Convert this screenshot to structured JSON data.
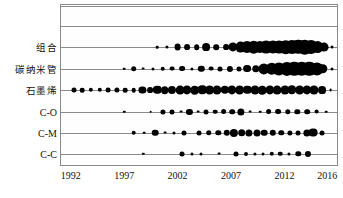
{
  "chart_data": {
    "type": "scatter",
    "title": "",
    "subtitle": "",
    "xlabel": "",
    "ylabel": "",
    "xlim": [
      1991,
      2017
    ],
    "xticks": [
      1992,
      1997,
      2002,
      2007,
      2012,
      2016
    ],
    "xtick_labels": [
      "1992",
      "1997",
      "2002",
      "2007",
      "2012",
      "2016"
    ],
    "categories": [
      "组合",
      "碳纳米管",
      "石墨烯",
      "C-O",
      "C-M",
      "C-C"
    ],
    "grid": true,
    "legend": "none",
    "size_encoding": "bubble area proportional to publication count",
    "series": [
      {
        "name": "组合",
        "points": [
          {
            "x": 2000.1,
            "s": 1.3
          },
          {
            "x": 2001.0,
            "s": 1.6
          },
          {
            "x": 2002.0,
            "s": 3.4
          },
          {
            "x": 2002.9,
            "s": 2.9
          },
          {
            "x": 2003.8,
            "s": 2.8
          },
          {
            "x": 2004.7,
            "s": 3.9
          },
          {
            "x": 2005.6,
            "s": 2.8
          },
          {
            "x": 2006.5,
            "s": 2.9
          },
          {
            "x": 2007.2,
            "s": 4.6
          },
          {
            "x": 2007.9,
            "s": 5.4
          },
          {
            "x": 2008.5,
            "s": 6.0
          },
          {
            "x": 2009.1,
            "s": 6.3
          },
          {
            "x": 2009.7,
            "s": 6.1
          },
          {
            "x": 2010.3,
            "s": 6.4
          },
          {
            "x": 2010.9,
            "s": 6.6
          },
          {
            "x": 2011.5,
            "s": 6.4
          },
          {
            "x": 2012.1,
            "s": 6.8
          },
          {
            "x": 2012.7,
            "s": 7.0
          },
          {
            "x": 2013.3,
            "s": 7.2
          },
          {
            "x": 2013.9,
            "s": 7.3
          },
          {
            "x": 2014.5,
            "s": 7.0
          },
          {
            "x": 2015.1,
            "s": 5.9
          },
          {
            "x": 2015.7,
            "s": 4.4
          },
          {
            "x": 2016.4,
            "s": 1.5
          }
        ]
      },
      {
        "name": "碳纳米管",
        "points": [
          {
            "x": 1997.0,
            "s": 1.3
          },
          {
            "x": 1997.9,
            "s": 2.8
          },
          {
            "x": 1998.8,
            "s": 1.4
          },
          {
            "x": 1999.7,
            "s": 1.5
          },
          {
            "x": 2000.6,
            "s": 2.3
          },
          {
            "x": 2001.5,
            "s": 2.4
          },
          {
            "x": 2002.4,
            "s": 2.9
          },
          {
            "x": 2003.3,
            "s": 1.6
          },
          {
            "x": 2004.2,
            "s": 3.2
          },
          {
            "x": 2005.1,
            "s": 2.4
          },
          {
            "x": 2006.0,
            "s": 2.5
          },
          {
            "x": 2006.9,
            "s": 3.1
          },
          {
            "x": 2007.7,
            "s": 2.5
          },
          {
            "x": 2008.5,
            "s": 3.9
          },
          {
            "x": 2009.3,
            "s": 3.7
          },
          {
            "x": 2010.1,
            "s": 5.6
          },
          {
            "x": 2010.8,
            "s": 6.2
          },
          {
            "x": 2011.5,
            "s": 6.6
          },
          {
            "x": 2012.2,
            "s": 7.1
          },
          {
            "x": 2012.9,
            "s": 7.2
          },
          {
            "x": 2013.6,
            "s": 7.3
          },
          {
            "x": 2014.3,
            "s": 7.2
          },
          {
            "x": 2015.0,
            "s": 6.6
          },
          {
            "x": 2015.6,
            "s": 4.7
          },
          {
            "x": 2016.4,
            "s": 1.5
          }
        ]
      },
      {
        "name": "石墨烯",
        "points": [
          {
            "x": 1992.3,
            "s": 2.5
          },
          {
            "x": 1993.1,
            "s": 2.3
          },
          {
            "x": 1993.9,
            "s": 2.2
          },
          {
            "x": 1994.7,
            "s": 2.2
          },
          {
            "x": 1995.5,
            "s": 2.4
          },
          {
            "x": 1996.3,
            "s": 2.6
          },
          {
            "x": 1997.1,
            "s": 2.3
          },
          {
            "x": 1997.9,
            "s": 2.3
          },
          {
            "x": 1998.7,
            "s": 3.6
          },
          {
            "x": 1999.4,
            "s": 2.9
          },
          {
            "x": 2000.1,
            "s": 4.2
          },
          {
            "x": 2000.8,
            "s": 3.8
          },
          {
            "x": 2001.5,
            "s": 4.1
          },
          {
            "x": 2002.2,
            "s": 4.4
          },
          {
            "x": 2002.9,
            "s": 4.6
          },
          {
            "x": 2003.6,
            "s": 4.3
          },
          {
            "x": 2004.3,
            "s": 4.7
          },
          {
            "x": 2005.0,
            "s": 4.4
          },
          {
            "x": 2005.7,
            "s": 4.5
          },
          {
            "x": 2006.4,
            "s": 4.2
          },
          {
            "x": 2007.1,
            "s": 4.6
          },
          {
            "x": 2007.8,
            "s": 4.4
          },
          {
            "x": 2008.5,
            "s": 4.2
          },
          {
            "x": 2009.2,
            "s": 4.5
          },
          {
            "x": 2009.9,
            "s": 4.3
          },
          {
            "x": 2010.6,
            "s": 4.6
          },
          {
            "x": 2011.3,
            "s": 4.4
          },
          {
            "x": 2012.0,
            "s": 4.5
          },
          {
            "x": 2012.7,
            "s": 4.7
          },
          {
            "x": 2013.4,
            "s": 4.4
          },
          {
            "x": 2014.1,
            "s": 4.6
          },
          {
            "x": 2014.8,
            "s": 4.5
          },
          {
            "x": 2015.5,
            "s": 3.9
          },
          {
            "x": 2016.3,
            "s": 1.4
          }
        ]
      },
      {
        "name": "C-O",
        "points": [
          {
            "x": 1997.0,
            "s": 1.2
          },
          {
            "x": 1999.5,
            "s": 1.3
          },
          {
            "x": 2000.6,
            "s": 2.6
          },
          {
            "x": 2001.5,
            "s": 2.5
          },
          {
            "x": 2002.3,
            "s": 1.4
          },
          {
            "x": 2003.1,
            "s": 3.1
          },
          {
            "x": 2003.9,
            "s": 1.4
          },
          {
            "x": 2004.7,
            "s": 2.5
          },
          {
            "x": 2005.5,
            "s": 2.3
          },
          {
            "x": 2006.3,
            "s": 2.9
          },
          {
            "x": 2007.1,
            "s": 2.8
          },
          {
            "x": 2007.9,
            "s": 3.6
          },
          {
            "x": 2008.8,
            "s": 1.4
          },
          {
            "x": 2009.7,
            "s": 1.3
          },
          {
            "x": 2010.5,
            "s": 2.9
          },
          {
            "x": 2011.4,
            "s": 2.9
          },
          {
            "x": 2012.3,
            "s": 2.7
          },
          {
            "x": 2013.2,
            "s": 2.7
          },
          {
            "x": 2014.1,
            "s": 2.8
          },
          {
            "x": 2015.0,
            "s": 2.4
          },
          {
            "x": 2015.9,
            "s": 1.3
          }
        ]
      },
      {
        "name": "C-M",
        "points": [
          {
            "x": 1997.9,
            "s": 2.3
          },
          {
            "x": 1998.9,
            "s": 1.3
          },
          {
            "x": 1999.9,
            "s": 3.3
          },
          {
            "x": 2000.8,
            "s": 1.4
          },
          {
            "x": 2001.7,
            "s": 1.5
          },
          {
            "x": 2002.6,
            "s": 2.5
          },
          {
            "x": 2004.0,
            "s": 2.5
          },
          {
            "x": 2004.9,
            "s": 2.8
          },
          {
            "x": 2005.8,
            "s": 2.7
          },
          {
            "x": 2006.6,
            "s": 3.2
          },
          {
            "x": 2007.3,
            "s": 4.1
          },
          {
            "x": 2008.0,
            "s": 3.8
          },
          {
            "x": 2008.7,
            "s": 3.6
          },
          {
            "x": 2009.4,
            "s": 3.5
          },
          {
            "x": 2010.1,
            "s": 3.3
          },
          {
            "x": 2010.9,
            "s": 3.2
          },
          {
            "x": 2011.7,
            "s": 2.7
          },
          {
            "x": 2012.5,
            "s": 2.6
          },
          {
            "x": 2013.3,
            "s": 2.5
          },
          {
            "x": 2014.1,
            "s": 3.6
          },
          {
            "x": 2014.7,
            "s": 4.4
          },
          {
            "x": 2015.5,
            "s": 2.5
          }
        ]
      },
      {
        "name": "C-C",
        "points": [
          {
            "x": 1998.8,
            "s": 1.2
          },
          {
            "x": 2002.4,
            "s": 2.5
          },
          {
            "x": 2003.3,
            "s": 1.6
          },
          {
            "x": 2004.2,
            "s": 1.5
          },
          {
            "x": 2005.9,
            "s": 1.4
          },
          {
            "x": 2007.5,
            "s": 2.5
          },
          {
            "x": 2008.4,
            "s": 2.0
          },
          {
            "x": 2009.2,
            "s": 1.6
          },
          {
            "x": 2010.0,
            "s": 1.5
          },
          {
            "x": 2010.8,
            "s": 2.2
          },
          {
            "x": 2011.6,
            "s": 2.3
          },
          {
            "x": 2012.4,
            "s": 1.6
          },
          {
            "x": 2013.3,
            "s": 2.7
          },
          {
            "x": 2014.2,
            "s": 3.1
          }
        ]
      }
    ]
  },
  "axis": {
    "tick_labels": [
      "1992",
      "1997",
      "2002",
      "2007",
      "2012",
      "2016"
    ],
    "row_labels": [
      "组合",
      "碳纳米管",
      "石墨烯",
      "C-O",
      "C-M",
      "C-C"
    ]
  },
  "colors": {
    "bubble": "#000000",
    "axis": "#8a8a8a",
    "text": "#111111",
    "background": "#ffffff"
  }
}
